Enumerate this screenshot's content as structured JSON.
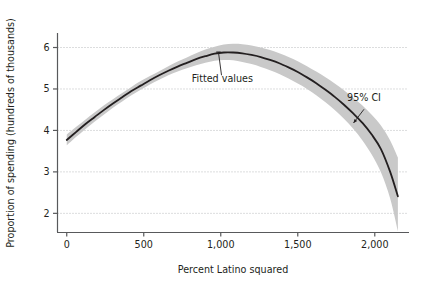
{
  "chart_data": {
    "type": "line",
    "title": "",
    "subtitle": "",
    "xlabel": "Percent Latino squared",
    "ylabel": "Proportion of spending (hundreds of thousands)",
    "xlim": [
      -60,
      2180
    ],
    "ylim": [
      1.55,
      6.35
    ],
    "xticks": [
      0,
      500,
      1000,
      1500,
      2000
    ],
    "xticklabels": [
      "0",
      "500",
      "1,000",
      "1,500",
      "2,000"
    ],
    "yticks": [
      2,
      3,
      4,
      5,
      6
    ],
    "yticklabels": [
      "2",
      "3",
      "4",
      "5",
      "6"
    ],
    "grid": "horizontal-dotted",
    "legend_position": "inline-annotations",
    "colors": {
      "fit_line": "#231f20",
      "ci_band": "#c9c9c9",
      "axis": "#58595b",
      "gridline": "#a7a9ac",
      "text": "#231f20",
      "background": "#ffffff"
    },
    "annotations": [
      {
        "name": "fitted-values",
        "text": "Fitted values",
        "text_x": 1010,
        "text_y": 5.18,
        "pointer_from_x": 1005,
        "pointer_from_y": 5.33,
        "pointer_to_x": 985,
        "pointer_to_y": 5.89,
        "arrow": "tick"
      },
      {
        "name": "ci-annotation",
        "text": "95% CI",
        "text_x": 1930,
        "text_y": 4.72,
        "pointer_from_x": 1930,
        "pointer_from_y": 4.51,
        "pointer_to_x": 1862,
        "pointer_to_y": 4.18,
        "arrow": "arrowhead"
      }
    ],
    "series": [
      {
        "name": "Fitted values",
        "x": [
          0,
          60,
          120,
          180,
          240,
          300,
          360,
          420,
          480,
          540,
          600,
          660,
          720,
          780,
          840,
          900,
          960,
          1020,
          1080,
          1140,
          1200,
          1260,
          1320,
          1380,
          1440,
          1500,
          1560,
          1620,
          1680,
          1740,
          1800,
          1860,
          1920,
          1980,
          2040,
          2100,
          2150
        ],
        "y": [
          3.77,
          3.96,
          4.15,
          4.32,
          4.49,
          4.65,
          4.8,
          4.95,
          5.08,
          5.21,
          5.33,
          5.44,
          5.54,
          5.63,
          5.72,
          5.79,
          5.85,
          5.88,
          5.88,
          5.86,
          5.82,
          5.77,
          5.7,
          5.62,
          5.52,
          5.41,
          5.28,
          5.14,
          4.98,
          4.81,
          4.62,
          4.41,
          4.18,
          3.9,
          3.55,
          3.0,
          2.41
        ]
      },
      {
        "name": "95% CI upper",
        "x": [
          0,
          60,
          120,
          180,
          240,
          300,
          360,
          420,
          480,
          540,
          600,
          660,
          720,
          780,
          840,
          900,
          960,
          1020,
          1080,
          1140,
          1200,
          1260,
          1320,
          1380,
          1440,
          1500,
          1560,
          1620,
          1680,
          1740,
          1800,
          1860,
          1920,
          1980,
          2040,
          2100,
          2150
        ],
        "y": [
          3.9,
          4.08,
          4.26,
          4.43,
          4.6,
          4.75,
          4.9,
          5.05,
          5.19,
          5.31,
          5.43,
          5.55,
          5.66,
          5.76,
          5.86,
          5.95,
          6.02,
          6.07,
          6.09,
          6.08,
          6.05,
          6.0,
          5.94,
          5.86,
          5.77,
          5.67,
          5.55,
          5.42,
          5.28,
          5.13,
          4.97,
          4.79,
          4.6,
          4.38,
          4.12,
          3.76,
          3.35
        ]
      },
      {
        "name": "95% CI lower",
        "x": [
          0,
          60,
          120,
          180,
          240,
          300,
          360,
          420,
          480,
          540,
          600,
          660,
          720,
          780,
          840,
          900,
          960,
          1020,
          1080,
          1140,
          1200,
          1260,
          1320,
          1380,
          1440,
          1500,
          1560,
          1620,
          1680,
          1740,
          1800,
          1860,
          1920,
          1980,
          2040,
          2100,
          2150
        ],
        "y": [
          3.64,
          3.84,
          4.03,
          4.21,
          4.38,
          4.55,
          4.7,
          4.85,
          4.98,
          5.11,
          5.22,
          5.33,
          5.42,
          5.5,
          5.57,
          5.63,
          5.68,
          5.7,
          5.69,
          5.65,
          5.6,
          5.53,
          5.45,
          5.36,
          5.25,
          5.13,
          5.0,
          4.85,
          4.68,
          4.49,
          4.28,
          4.04,
          3.76,
          3.42,
          2.99,
          2.36,
          1.57
        ]
      }
    ]
  },
  "axes": {
    "y_axis_title": "Proportion of spending (hundreds of thousands)",
    "x_axis_title": "Percent Latino squared"
  }
}
